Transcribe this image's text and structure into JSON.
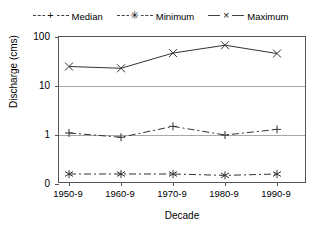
{
  "chart_data": {
    "type": "line",
    "title": "",
    "xlabel": "Decade",
    "ylabel": "Discharge (cms)",
    "categories": [
      "1950-9",
      "1960-9",
      "1970-9",
      "1980-9",
      "1990-9"
    ],
    "yticks": [
      "100",
      "10",
      "1",
      "0"
    ],
    "ytick_values": [
      100,
      10,
      1,
      0
    ],
    "ylim": [
      0,
      100
    ],
    "yscale": "log",
    "grid": "horizontal",
    "legend_position": "top",
    "series": [
      {
        "name": "Median",
        "marker": "plus",
        "linestyle": "dash-dot",
        "color": "#333333",
        "values": [
          1.1,
          0.9,
          1.5,
          1.0,
          1.3
        ]
      },
      {
        "name": "Minimum",
        "marker": "asterisk",
        "linestyle": "dash-dot",
        "color": "#333333",
        "values": [
          0.16,
          0.16,
          0.16,
          0.15,
          0.16
        ]
      },
      {
        "name": "Maximum",
        "marker": "x",
        "linestyle": "solid",
        "color": "#333333",
        "values": [
          25,
          23,
          47,
          68,
          46
        ]
      }
    ]
  },
  "legend": {
    "entries": [
      {
        "label": "Median",
        "marker": "+",
        "style": "dashdot"
      },
      {
        "label": "Minimum",
        "marker": "✳",
        "style": "dashed"
      },
      {
        "label": "Maximum",
        "marker": "×",
        "style": "solid"
      }
    ]
  },
  "colors": {
    "axis": "#555555",
    "grid": "#a8a8a8",
    "series": "#333333",
    "background": "#ffffff"
  }
}
